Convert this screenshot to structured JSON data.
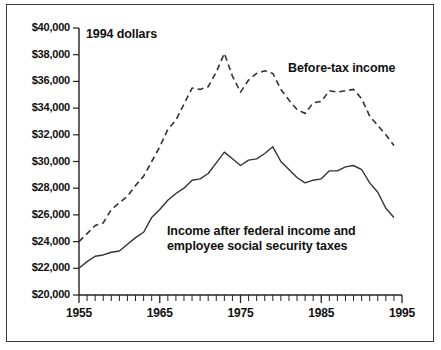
{
  "chart_data": {
    "type": "line",
    "title": "",
    "xlabel": "",
    "ylabel": "",
    "units_note": "1994 dollars",
    "grid": false,
    "legend_position": "inline-annotations",
    "xlim": [
      1955,
      1995
    ],
    "ylim": [
      20000,
      40000
    ],
    "y_ticks": [
      20000,
      22000,
      24000,
      26000,
      28000,
      30000,
      32000,
      34000,
      36000,
      38000,
      40000
    ],
    "y_tick_labels": [
      "$20,000",
      "$22,000",
      "$24,000",
      "$26,000",
      "$28,000",
      "$30,000",
      "$32,000",
      "$34,000",
      "$36,000",
      "$38,000",
      "$40,000"
    ],
    "x_ticks": [
      1955,
      1965,
      1975,
      1985,
      1995
    ],
    "x_tick_labels": [
      "1955",
      "1965",
      "1975",
      "1985",
      "1995"
    ],
    "x_minor_tick_interval": 1,
    "annotations": [
      {
        "id": "units",
        "text": "1994 dollars"
      },
      {
        "id": "before",
        "text": "Before-tax income"
      },
      {
        "id": "after",
        "text": "Income after federal income and\nemployee social security taxes"
      }
    ],
    "x": [
      1955,
      1956,
      1957,
      1958,
      1959,
      1960,
      1961,
      1962,
      1963,
      1964,
      1965,
      1966,
      1967,
      1968,
      1969,
      1970,
      1971,
      1972,
      1973,
      1974,
      1975,
      1976,
      1977,
      1978,
      1979,
      1980,
      1981,
      1982,
      1983,
      1984,
      1985,
      1986,
      1987,
      1988,
      1989,
      1990,
      1991,
      1992,
      1993,
      1994
    ],
    "series": [
      {
        "name": "Before-tax income",
        "style": "dashed",
        "color": "#333333",
        "values": [
          24000,
          24600,
          25200,
          25400,
          26400,
          26900,
          27400,
          28200,
          28900,
          30000,
          31100,
          32400,
          33100,
          34300,
          35500,
          35400,
          35600,
          36700,
          38100,
          36400,
          35200,
          36100,
          36600,
          36800,
          36600,
          35400,
          34600,
          33900,
          33600,
          34400,
          34500,
          35300,
          35200,
          35300,
          35400,
          34700,
          33400,
          32700,
          32000,
          31200
        ]
      },
      {
        "name": "Income after federal income and employee social security taxes",
        "style": "solid",
        "color": "#333333",
        "values": [
          22000,
          22500,
          22900,
          23000,
          23200,
          23300,
          23800,
          24300,
          24700,
          25800,
          26400,
          27100,
          27600,
          28000,
          28600,
          28700,
          29100,
          29900,
          30700,
          30200,
          29700,
          30100,
          30200,
          30600,
          31100,
          30000,
          29400,
          28800,
          28400,
          28600,
          28700,
          29300,
          29300,
          29600,
          29700,
          29400,
          28400,
          27700,
          26500,
          25800
        ]
      }
    ]
  }
}
